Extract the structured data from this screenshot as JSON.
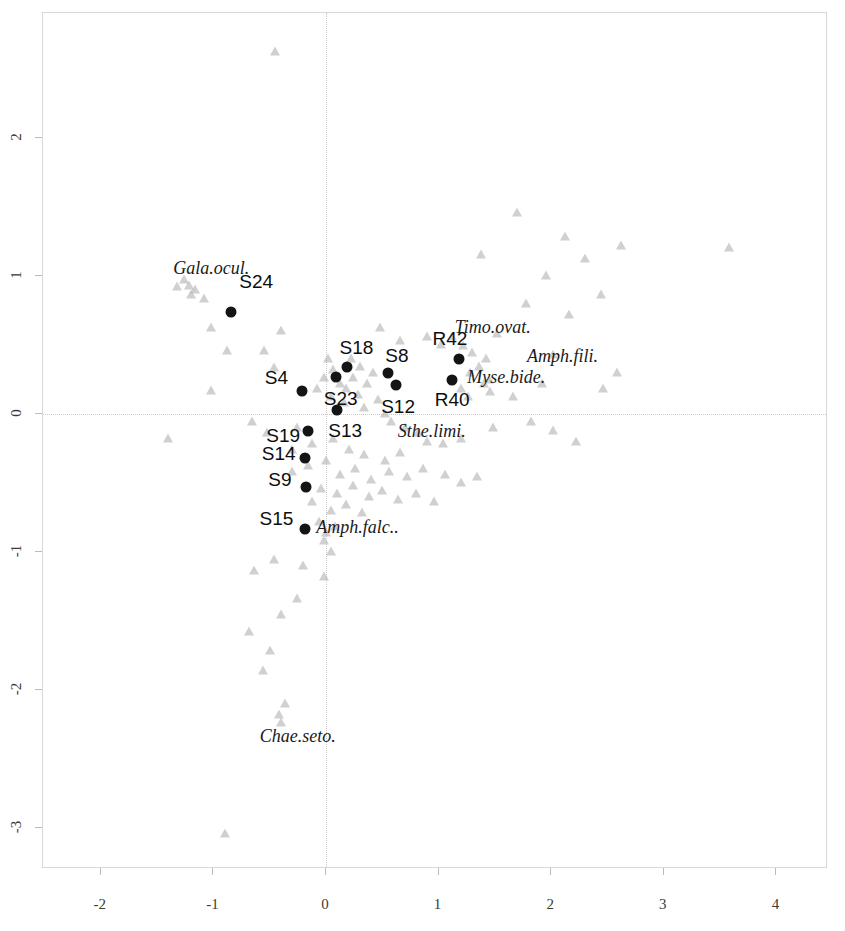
{
  "chart_data": {
    "type": "scatter",
    "title": "",
    "xlabel": "0.246 (31.4%)",
    "ylabel": "0.204 (26.1%)",
    "xlim": [
      -2.55,
      4.45
    ],
    "ylim": [
      -3.3,
      2.9
    ],
    "grid": false,
    "legend": "none",
    "xticks": [
      -2,
      -1,
      0,
      1,
      2,
      3,
      4
    ],
    "xtick_labels": [
      "-2",
      "-1",
      "0",
      "1",
      "2",
      "3",
      "4"
    ],
    "yticks": [
      2,
      1,
      0,
      -1,
      -2,
      -3
    ],
    "ytick_labels": [
      "2",
      "1",
      "0",
      "-1",
      "-2",
      "-3"
    ],
    "zero_lines": true,
    "series": [
      {
        "name": "sites",
        "marker": "filled-circle",
        "color": "#141414",
        "points": [
          {
            "label": "S24",
            "x": -0.84,
            "y": 0.74,
            "lx": -0.62,
            "ly": 0.96
          },
          {
            "label": "S4",
            "x": -0.21,
            "y": 0.17,
            "lx": -0.44,
            "ly": 0.26
          },
          {
            "label": "S18",
            "x": 0.19,
            "y": 0.34,
            "lx": 0.27,
            "ly": 0.48
          },
          {
            "label": "S23",
            "x": 0.09,
            "y": 0.27,
            "lx": 0.13,
            "ly": 0.11
          },
          {
            "label": "S13",
            "x": 0.1,
            "y": 0.03,
            "lx": 0.17,
            "ly": -0.12
          },
          {
            "label": "S8",
            "x": 0.55,
            "y": 0.3,
            "lx": 0.63,
            "ly": 0.42
          },
          {
            "label": "S12",
            "x": 0.62,
            "y": 0.21,
            "lx": 0.64,
            "ly": 0.05
          },
          {
            "label": "R42",
            "x": 1.18,
            "y": 0.4,
            "lx": 1.1,
            "ly": 0.54
          },
          {
            "label": "R40",
            "x": 1.12,
            "y": 0.25,
            "lx": 1.12,
            "ly": 0.1
          },
          {
            "label": "S19",
            "x": -0.16,
            "y": -0.12,
            "lx": -0.38,
            "ly": -0.16
          },
          {
            "label": "S14",
            "x": -0.19,
            "y": -0.32,
            "lx": -0.42,
            "ly": -0.29
          },
          {
            "label": "S9",
            "x": -0.18,
            "y": -0.53,
            "lx": -0.41,
            "ly": -0.48
          },
          {
            "label": "S15",
            "x": -0.19,
            "y": -0.83,
            "lx": -0.44,
            "ly": -0.76
          }
        ]
      },
      {
        "name": "species",
        "marker": "open-triangle",
        "color": "#aaaaaa",
        "labeled_points": [
          {
            "label": "Gala.ocul.",
            "x": -1.22,
            "y": 0.93,
            "lx": -1.02,
            "ly": 1.06
          },
          {
            "label": "Timo.ovat.",
            "x": 1.52,
            "y": 0.58,
            "lx": 1.48,
            "ly": 0.63
          },
          {
            "label": "Amph.fili.",
            "x": 2.02,
            "y": 0.43,
            "lx": 2.1,
            "ly": 0.42
          },
          {
            "label": "Myse.bide.",
            "x": 1.45,
            "y": 0.25,
            "lx": 1.6,
            "ly": 0.27
          },
          {
            "label": "Sthe.limi.",
            "x": 0.82,
            "y": -0.14,
            "lx": 0.94,
            "ly": -0.12
          },
          {
            "label": "Amph.falc..",
            "x": 0.0,
            "y": -0.86,
            "lx": 0.28,
            "ly": -0.82
          },
          {
            "label": "Chae.seto.",
            "x": -0.42,
            "y": -2.18,
            "lx": -0.25,
            "ly": -2.33
          }
        ],
        "points": [
          {
            "x": -0.45,
            "y": 2.62
          },
          {
            "x": 1.7,
            "y": 1.46
          },
          {
            "x": 2.12,
            "y": 1.28
          },
          {
            "x": 1.38,
            "y": 1.15
          },
          {
            "x": 2.3,
            "y": 1.12
          },
          {
            "x": 1.95,
            "y": 1.0
          },
          {
            "x": 2.62,
            "y": 1.22
          },
          {
            "x": 3.58,
            "y": 1.2
          },
          {
            "x": 1.78,
            "y": 0.8
          },
          {
            "x": 2.44,
            "y": 0.86
          },
          {
            "x": 2.16,
            "y": 0.72
          },
          {
            "x": -1.26,
            "y": 0.97
          },
          {
            "x": -1.2,
            "y": 0.86
          },
          {
            "x": -1.16,
            "y": 0.9
          },
          {
            "x": -1.32,
            "y": 0.92
          },
          {
            "x": -1.08,
            "y": 0.83
          },
          {
            "x": -1.02,
            "y": 0.62
          },
          {
            "x": -0.88,
            "y": 0.46
          },
          {
            "x": -0.55,
            "y": 0.46
          },
          {
            "x": -0.46,
            "y": 0.33
          },
          {
            "x": -0.4,
            "y": 0.6
          },
          {
            "x": 0.48,
            "y": 0.62
          },
          {
            "x": 0.66,
            "y": 0.53
          },
          {
            "x": 0.9,
            "y": 0.56
          },
          {
            "x": 1.02,
            "y": 0.5
          },
          {
            "x": 1.12,
            "y": 0.56
          },
          {
            "x": 1.22,
            "y": 0.49
          },
          {
            "x": 1.3,
            "y": 0.44
          },
          {
            "x": 1.42,
            "y": 0.4
          },
          {
            "x": 1.28,
            "y": 0.3
          },
          {
            "x": 1.36,
            "y": 0.34
          },
          {
            "x": 1.4,
            "y": 0.22
          },
          {
            "x": 1.46,
            "y": 0.16
          },
          {
            "x": 1.2,
            "y": 0.18
          },
          {
            "x": 1.26,
            "y": 0.12
          },
          {
            "x": 0.02,
            "y": 0.4
          },
          {
            "x": 0.06,
            "y": 0.32
          },
          {
            "x": -0.02,
            "y": 0.26
          },
          {
            "x": 0.12,
            "y": 0.22
          },
          {
            "x": 0.18,
            "y": 0.18
          },
          {
            "x": 0.24,
            "y": 0.26
          },
          {
            "x": 0.3,
            "y": 0.34
          },
          {
            "x": 0.36,
            "y": 0.22
          },
          {
            "x": 0.42,
            "y": 0.3
          },
          {
            "x": 0.22,
            "y": 0.4
          },
          {
            "x": -0.08,
            "y": 0.18
          },
          {
            "x": 0.04,
            "y": 0.12
          },
          {
            "x": 0.16,
            "y": 0.08
          },
          {
            "x": 0.28,
            "y": 0.14
          },
          {
            "x": 0.34,
            "y": 0.04
          },
          {
            "x": 0.46,
            "y": 0.1
          },
          {
            "x": 0.52,
            "y": 0.0
          },
          {
            "x": 0.58,
            "y": -0.06
          },
          {
            "x": 0.7,
            "y": -0.1
          },
          {
            "x": 0.9,
            "y": -0.2
          },
          {
            "x": 1.04,
            "y": -0.22
          },
          {
            "x": 1.2,
            "y": -0.18
          },
          {
            "x": 1.48,
            "y": -0.1
          },
          {
            "x": 1.82,
            "y": -0.06
          },
          {
            "x": 2.02,
            "y": -0.12
          },
          {
            "x": 2.22,
            "y": -0.2
          },
          {
            "x": 2.46,
            "y": 0.18
          },
          {
            "x": 2.58,
            "y": 0.3
          },
          {
            "x": 1.66,
            "y": 0.12
          },
          {
            "x": 1.92,
            "y": 0.22
          },
          {
            "x": -0.26,
            "y": -0.1
          },
          {
            "x": -0.52,
            "y": -0.14
          },
          {
            "x": -0.66,
            "y": -0.06
          },
          {
            "x": -0.3,
            "y": -0.26
          },
          {
            "x": -0.12,
            "y": -0.22
          },
          {
            "x": 0.06,
            "y": -0.18
          },
          {
            "x": 0.2,
            "y": -0.26
          },
          {
            "x": 0.34,
            "y": -0.3
          },
          {
            "x": 0.52,
            "y": -0.34
          },
          {
            "x": 0.66,
            "y": -0.28
          },
          {
            "x": -0.3,
            "y": -0.42
          },
          {
            "x": -0.16,
            "y": -0.38
          },
          {
            "x": 0.0,
            "y": -0.34
          },
          {
            "x": 0.12,
            "y": -0.44
          },
          {
            "x": 0.26,
            "y": -0.4
          },
          {
            "x": 0.4,
            "y": -0.48
          },
          {
            "x": 0.56,
            "y": -0.42
          },
          {
            "x": 0.72,
            "y": -0.46
          },
          {
            "x": 0.86,
            "y": -0.4
          },
          {
            "x": 1.06,
            "y": -0.44
          },
          {
            "x": 1.2,
            "y": -0.5
          },
          {
            "x": 1.34,
            "y": -0.46
          },
          {
            "x": -0.04,
            "y": -0.54
          },
          {
            "x": 0.1,
            "y": -0.58
          },
          {
            "x": 0.24,
            "y": -0.52
          },
          {
            "x": 0.38,
            "y": -0.6
          },
          {
            "x": 0.5,
            "y": -0.56
          },
          {
            "x": 0.64,
            "y": -0.62
          },
          {
            "x": 0.8,
            "y": -0.58
          },
          {
            "x": 0.96,
            "y": -0.64
          },
          {
            "x": -0.12,
            "y": -0.64
          },
          {
            "x": 0.04,
            "y": -0.7
          },
          {
            "x": 0.18,
            "y": -0.66
          },
          {
            "x": 0.32,
            "y": -0.72
          },
          {
            "x": -0.06,
            "y": -0.78
          },
          {
            "x": 0.08,
            "y": -0.82
          },
          {
            "x": -0.02,
            "y": -0.92
          },
          {
            "x": 0.04,
            "y": -1.0
          },
          {
            "x": -0.46,
            "y": -1.06
          },
          {
            "x": -0.64,
            "y": -1.14
          },
          {
            "x": -0.2,
            "y": -1.1
          },
          {
            "x": -0.02,
            "y": -1.18
          },
          {
            "x": -0.26,
            "y": -1.34
          },
          {
            "x": -0.4,
            "y": -1.46
          },
          {
            "x": -0.68,
            "y": -1.58
          },
          {
            "x": -0.5,
            "y": -1.72
          },
          {
            "x": -0.56,
            "y": -1.86
          },
          {
            "x": -0.36,
            "y": -2.1
          },
          {
            "x": -0.4,
            "y": -2.24
          },
          {
            "x": -0.9,
            "y": -3.04
          },
          {
            "x": -1.02,
            "y": 0.17
          },
          {
            "x": -1.4,
            "y": -0.18
          }
        ]
      }
    ]
  }
}
